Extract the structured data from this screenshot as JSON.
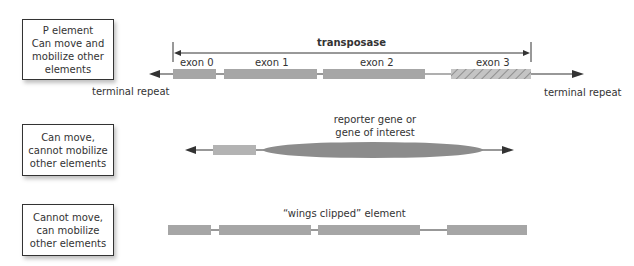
{
  "rows": [
    {
      "box_lines": [
        "P element",
        "Can move and",
        "mobilize other",
        "elements"
      ],
      "transposase_label": "transposase",
      "exons": [
        "exon 0",
        "exon 1",
        "exon 2",
        "exon 3"
      ],
      "left_repeat_label": "terminal repeat",
      "right_repeat_label": "terminal repeat"
    },
    {
      "box_lines": [
        "Can move,",
        "cannot mobilize",
        "other elements"
      ],
      "insert_label_lines": [
        "reporter gene or",
        "gene of interest"
      ]
    },
    {
      "box_lines": [
        "Cannot move,",
        "can mobilize",
        "other elements"
      ],
      "element_label": "“wings clipped” element"
    }
  ],
  "colors": {
    "exon": "#a6a6a6",
    "exon_light": "#b3b3b3",
    "insert": "#8c8c8c",
    "line": "#333333",
    "intron": "#bfbfbf"
  }
}
